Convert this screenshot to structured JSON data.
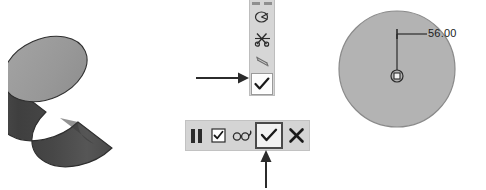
{
  "scene": {
    "background_color": "#ffffff",
    "title": "CAD extrude confirmation annotated screenshot"
  },
  "model_view": {
    "name": "cylinder-3d-preview",
    "shape": "cylinder",
    "top_face_color": "#9a9a9a",
    "body_color": "#555555",
    "body_shadow_color": "#3d3d3d",
    "outline_color": "#2e2e2e"
  },
  "vertical_toolbar": {
    "name": "context-mini-toolbar",
    "background_color": "#d6d6d6",
    "border_color": "#bdbdbd",
    "grip_label": "drag-handle",
    "items": [
      {
        "icon": "sketch-region-icon",
        "label": "Sketch region",
        "selected": false
      },
      {
        "icon": "trim-scissors-icon",
        "label": "Trim",
        "selected": false
      },
      {
        "icon": "dimension-icon",
        "label": "Dimension",
        "selected": false
      },
      {
        "icon": "check-icon",
        "label": "Accept",
        "selected": true
      }
    ]
  },
  "horizontal_toolbar": {
    "name": "sketch-confirm-toolbar",
    "background_color": "#d4d4d4",
    "border_color": "#c2c2c2",
    "grip_label": "drag-handle",
    "items": [
      {
        "icon": "checkbox-checked-icon",
        "label": "Option",
        "selected": false
      },
      {
        "icon": "glasses-icon",
        "label": "View / Preview",
        "selected": false
      },
      {
        "icon": "check-icon",
        "label": "OK",
        "selected": true,
        "highlight_color": "#4a4a4a"
      },
      {
        "icon": "close-x-icon",
        "label": "Cancel",
        "selected": false
      }
    ]
  },
  "annotations": {
    "arrow_right": {
      "name": "callout-arrow-right",
      "points_to": "vertical toolbar accept check button",
      "color": "#2b2b2b"
    },
    "arrow_up": {
      "name": "callout-arrow-up",
      "points_to": "horizontal toolbar OK check button",
      "color": "#2b2b2b"
    }
  },
  "sketch_view": {
    "name": "circle-sketch-preview",
    "shape": "circle",
    "fill_color": "#b3b3b3",
    "outline_color": "#8a8a8a",
    "center_marker": "center-point-icon",
    "dimension": {
      "name": "diameter-dimension",
      "value": "56.00",
      "leader_color": "#2b2b2b"
    }
  }
}
